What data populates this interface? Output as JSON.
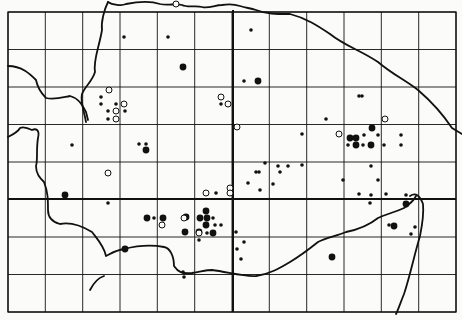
{
  "map": {
    "type": "distribution-grid-map",
    "background": "#fbfbfa",
    "ink": "#111111",
    "grid": {
      "left": 8,
      "right": 456,
      "top": 12,
      "bottom": 312,
      "verticals": [
        8,
        45.3,
        82.7,
        120,
        157.3,
        194.7,
        232,
        269.3,
        306.7,
        344,
        381.3,
        418.7,
        456
      ],
      "horizontals": [
        12,
        49.5,
        87,
        124.5,
        162,
        199.5,
        237,
        274.5,
        312
      ],
      "thick_vertical": 233,
      "thick_horizontal": 199
    },
    "legend": {
      "large_filled": "large filled dot",
      "small_filled": "small filled dot",
      "open": "open circle"
    },
    "points": {
      "large_filled": [
        [
          183,
          67
        ],
        [
          258,
          81
        ],
        [
          146,
          150
        ],
        [
          65,
          195
        ],
        [
          125,
          249
        ],
        [
          147,
          218
        ],
        [
          163,
          218
        ],
        [
          186,
          217
        ],
        [
          206,
          211
        ],
        [
          200,
          218
        ],
        [
          207,
          218
        ],
        [
          206,
          225
        ],
        [
          199,
          232
        ],
        [
          185,
          232
        ],
        [
          213,
          233
        ],
        [
          350,
          138
        ],
        [
          356,
          138
        ],
        [
          372,
          128
        ],
        [
          356,
          145
        ],
        [
          371,
          145
        ],
        [
          406,
          204
        ],
        [
          394,
          226
        ],
        [
          332,
          257
        ]
      ],
      "small_filled": [
        [
          124,
          37
        ],
        [
          168,
          37
        ],
        [
          251,
          30
        ],
        [
          244,
          81
        ],
        [
          101,
          97
        ],
        [
          101,
          104
        ],
        [
          116,
          104
        ],
        [
          108,
          111
        ],
        [
          125,
          111
        ],
        [
          108,
          119
        ],
        [
          72,
          145
        ],
        [
          139,
          144
        ],
        [
          146,
          144
        ],
        [
          221,
          104
        ],
        [
          265,
          163
        ],
        [
          359,
          96
        ],
        [
          362,
          96
        ],
        [
          326,
          119
        ],
        [
          364,
          135
        ],
        [
          378,
          135
        ],
        [
          348,
          145
        ],
        [
          363,
          145
        ],
        [
          384,
          145
        ],
        [
          401,
          135
        ],
        [
          401,
          145
        ],
        [
          302,
          134
        ],
        [
          302,
          165
        ],
        [
          288,
          166
        ],
        [
          278,
          166
        ],
        [
          280,
          172
        ],
        [
          259,
          172
        ],
        [
          248,
          183
        ],
        [
          273,
          184
        ],
        [
          216,
          193
        ],
        [
          108,
          203
        ],
        [
          154,
          218
        ],
        [
          213,
          218
        ],
        [
          215,
          225
        ],
        [
          221,
          225
        ],
        [
          207,
          233
        ],
        [
          199,
          240
        ],
        [
          236,
          232
        ],
        [
          244,
          242
        ],
        [
          237,
          249
        ],
        [
          260,
          190
        ],
        [
          256,
          172
        ],
        [
          343,
          180
        ],
        [
          371,
          166
        ],
        [
          378,
          180
        ],
        [
          371,
          195
        ],
        [
          370,
          203
        ],
        [
          386,
          194
        ],
        [
          406,
          195
        ],
        [
          415,
          227
        ],
        [
          411,
          234
        ],
        [
          241,
          259
        ],
        [
          359,
          194
        ],
        [
          389,
          225
        ],
        [
          183,
          272
        ],
        [
          184,
          277
        ]
      ],
      "open": [
        [
          176,
          4
        ],
        [
          109,
          90
        ],
        [
          124,
          104
        ],
        [
          116,
          111
        ],
        [
          116,
          119
        ],
        [
          221,
          97
        ],
        [
          228,
          104
        ],
        [
          237,
          127
        ],
        [
          108,
          173
        ],
        [
          230,
          188
        ],
        [
          230,
          193
        ],
        [
          206,
          193
        ],
        [
          162,
          225
        ],
        [
          184,
          218
        ],
        [
          199,
          233
        ],
        [
          339,
          134
        ],
        [
          385,
          119
        ]
      ]
    },
    "coastlines": [
      "M 108 2 C 112 5 122 6 126 4 C 136 2 148 0 160 4 C 168 6 176 3 182 5 C 188 8 196 5 202 7 C 208 9 215 5 222 5 C 228 4 234 4 240 6 C 246 8 250 8 256 10 C 266 14 276 14 290 14 C 306 18 318 26 330 34 C 345 46 360 50 378 62 C 392 74 405 80 418 90 C 432 102 444 116 452 128 L 462 134",
      "M 108 2 C 104 10 101 22 102 30 C 99 48 93 60 95 72 C 92 82 85 86 82 94 C 80 102 84 110 86 122",
      "M 8 66 C 22 66 30 74 36 80 C 38 90 44 96 46 98 C 54 100 60 98 70 96 C 78 98 82 104 86 112 L 88 120",
      "M 8 137 C 14 134 18 132 20 128 C 24 126 28 128 32 130 C 36 128 40 130 38 138 C 36 150 38 160 36 166 C 36 174 40 178 44 182 C 48 192 48 200 48 210 C 48 218 52 222 60 224 C 70 222 82 226 92 232 C 98 240 104 246 106 256 C 110 254 116 250 124 249 C 136 246 148 244 164 247 C 170 248 174 256 174 266 C 178 272 182 274 192 273 C 200 272 206 270 212 270 C 228 272 244 277 256 276 C 270 274 280 268 290 262 C 300 256 308 250 318 242 C 326 238 336 236 346 232 C 356 230 368 226 378 218 C 386 214 396 212 404 208 C 410 204 414 200 416 196",
      "M 410 196 C 416 192 420 196 423 204 C 424 214 422 226 420 236 C 414 256 410 276 404 294 C 400 304 398 310 396 314",
      "M 90 290 C 94 282 98 278 104 276"
    ]
  }
}
